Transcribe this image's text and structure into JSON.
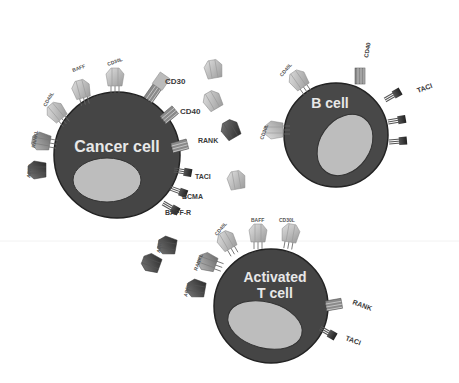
{
  "diagram": {
    "cells": [
      {
        "id": "cancer",
        "label": "Cancer cell",
        "color": "#444444",
        "nucleus_color": "#bdbdbd"
      },
      {
        "id": "bcell",
        "label": "B cell",
        "color": "#4a4a4a",
        "nucleus_color": "#bdbdbd"
      },
      {
        "id": "tcell",
        "label_line1": "Activated",
        "label_line2": "T cell",
        "color": "#444444",
        "nucleus_color": "#bdbdbd"
      }
    ],
    "cancer_receptors": {
      "cd30": "CD30",
      "cd40": "CD40",
      "rank": "RANK",
      "taci": "TACI",
      "bcma": "BCMA",
      "baffr": "BAFF-R",
      "cd30l": "CD30L",
      "baff": "BAFF",
      "cd40l": "CD40L",
      "rankl": "RANKL",
      "april": "APRIL"
    },
    "bcell_receptors": {
      "cd40": "CD40",
      "taci": "TACI",
      "cd40l": "CD40L",
      "cd30l": "CD30L"
    },
    "tcell_receptors": {
      "cd40l": "CD40L",
      "baff": "BAFF",
      "cd30l": "CD30L",
      "rankl": "RANKL",
      "april": "APRIL",
      "april2": "APRIL",
      "rank": "RANK",
      "taci": "TACI"
    }
  }
}
